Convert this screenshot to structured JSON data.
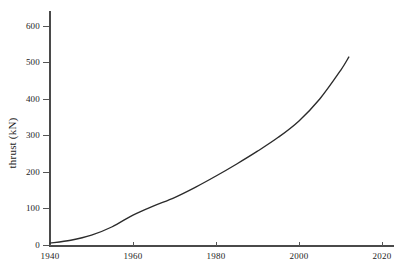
{
  "chart_data": {
    "type": "line",
    "title": "",
    "xlabel": "",
    "ylabel": "thrust (kN)",
    "xlim": [
      1940,
      2022
    ],
    "ylim": [
      0,
      640
    ],
    "grid": false,
    "legend": null,
    "x_ticks": [
      1940,
      1960,
      1980,
      2000,
      2020
    ],
    "y_ticks": [
      0,
      100,
      200,
      300,
      400,
      500,
      600
    ],
    "series": [
      {
        "name": "thrust",
        "color": "#2b2b2b",
        "x": [
          1940,
          1945,
          1950,
          1955,
          1960,
          1965,
          1970,
          1975,
          1980,
          1985,
          1990,
          1995,
          2000,
          2005,
          2010,
          2012
        ],
        "values": [
          5,
          13,
          27,
          50,
          82,
          107,
          130,
          158,
          189,
          222,
          257,
          295,
          340,
          400,
          478,
          515
        ]
      }
    ]
  },
  "axes": {
    "y": {
      "label": "thrust (kN)",
      "ticks": [
        {
          "value": 600,
          "text": "600"
        },
        {
          "value": 500,
          "text": "500"
        },
        {
          "value": 400,
          "text": "400"
        },
        {
          "value": 300,
          "text": "300"
        },
        {
          "value": 200,
          "text": "200"
        },
        {
          "value": 100,
          "text": "100"
        },
        {
          "value": 0,
          "text": "0"
        }
      ]
    },
    "x": {
      "label": "",
      "ticks": [
        {
          "value": 1940,
          "text": "1940"
        },
        {
          "value": 1960,
          "text": "1960"
        },
        {
          "value": 1980,
          "text": "1980"
        },
        {
          "value": 2000,
          "text": "2000"
        },
        {
          "value": 2020,
          "text": "2020"
        }
      ]
    }
  },
  "style": {
    "axis_color": "#4a4a4a",
    "curve_color": "#2b2b2b",
    "text_color": "#1c1c1c",
    "background": "#ffffff"
  }
}
